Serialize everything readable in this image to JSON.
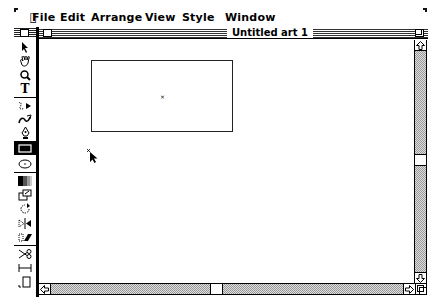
{
  "menubar": {
    "apple_icon": "apple-icon",
    "items": [
      {
        "label": "File",
        "x": 18
      },
      {
        "label": "Edit",
        "x": 46
      },
      {
        "label": "Arrange",
        "x": 77
      },
      {
        "label": "View",
        "x": 131
      },
      {
        "label": "Style",
        "x": 168
      },
      {
        "label": "Window",
        "x": 211
      }
    ]
  },
  "toolbox": {
    "tools": [
      {
        "name": "selection-arrow",
        "icon": "arrow-icon",
        "glyph": "▲"
      },
      {
        "name": "hand",
        "icon": "hand-icon",
        "glyph": "✋"
      },
      {
        "name": "zoom",
        "icon": "magnifier-icon",
        "glyph": "Q"
      },
      {
        "name": "text",
        "icon": "text-icon",
        "glyph": "T"
      },
      {
        "name": "freehand",
        "icon": "freehand-icon",
        "glyph": "∿"
      },
      {
        "name": "autotrace",
        "icon": "autotrace-icon",
        "glyph": "≈"
      },
      {
        "name": "pen",
        "icon": "pen-icon",
        "glyph": "♦"
      },
      {
        "name": "rectangle",
        "icon": "rectangle-icon",
        "glyph": "▭",
        "selected": true
      },
      {
        "name": "oval",
        "icon": "oval-icon",
        "glyph": "⬭"
      },
      {
        "name": "blend",
        "icon": "blend-icon",
        "glyph": "▓"
      },
      {
        "name": "scale",
        "icon": "scale-icon",
        "glyph": "⧉"
      },
      {
        "name": "rotate",
        "icon": "rotate-icon",
        "glyph": "↻"
      },
      {
        "name": "reflect",
        "icon": "reflect-icon",
        "glyph": "▷◁"
      },
      {
        "name": "shear",
        "icon": "shear-icon",
        "glyph": "▱"
      },
      {
        "name": "scissors",
        "icon": "scissors-icon",
        "glyph": "✂"
      },
      {
        "name": "measure",
        "icon": "measure-icon",
        "glyph": "⟛"
      },
      {
        "name": "page",
        "icon": "page-icon",
        "glyph": "□"
      }
    ]
  },
  "window": {
    "title": "Untitled art 1",
    "close_box": "close-box",
    "zoom_box": "zoom-box"
  },
  "canvas": {
    "rectangle": {
      "x": 52,
      "y": 20,
      "width": 142,
      "height": 72
    },
    "center_mark": "×",
    "cursor": "rectangle-crosshair-cursor"
  },
  "scrollbars": {
    "vertical": {
      "thumb_position": 114,
      "up_arrow": "⇧",
      "down_arrow": "⇩"
    },
    "horizontal": {
      "thumb_position": 171,
      "left_arrow": "⇦",
      "right_arrow": "⇨"
    }
  },
  "colors": {
    "foreground": "#000000",
    "background": "#ffffff",
    "scroll_track": "#aaaaaa"
  }
}
